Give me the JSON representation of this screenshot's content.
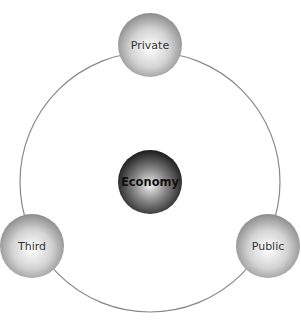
{
  "diagram": {
    "title": "",
    "center": {
      "label": "Economy",
      "x": 150,
      "y": 182,
      "r": 32
    },
    "ring": {
      "cx": 150,
      "cy": 182,
      "r": 130,
      "stroke": "#888888"
    },
    "nodes": [
      {
        "id": "private",
        "label": "Private",
        "x": 150,
        "y": 45,
        "r": 32
      },
      {
        "id": "third",
        "label": "Third",
        "x": 32,
        "y": 246,
        "r": 32
      },
      {
        "id": "public",
        "label": "Public",
        "x": 268,
        "y": 246,
        "r": 32
      }
    ]
  }
}
